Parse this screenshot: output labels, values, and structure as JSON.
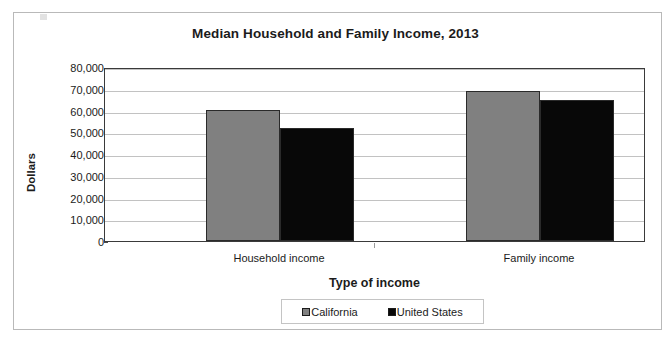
{
  "chart_data": {
    "type": "bar",
    "title": "Median Household and Family Income, 2013",
    "xlabel": "Type of income",
    "ylabel": "Dollars",
    "categories": [
      "Household income",
      "Family income"
    ],
    "series": [
      {
        "name": "California",
        "color": "#808080",
        "values": [
          60200,
          69000
        ]
      },
      {
        "name": "United States",
        "color": "#080808",
        "values": [
          52100,
          64800
        ]
      }
    ],
    "ylim": [
      0,
      80000
    ],
    "ytick_step": 10000,
    "ytick_labels": [
      "80,000",
      "70,000",
      "60,000",
      "50,000",
      "40,000",
      "30,000",
      "20,000",
      "10,000",
      "0"
    ],
    "ytick_values": [
      80000,
      70000,
      60000,
      50000,
      40000,
      30000,
      20000,
      10000,
      0
    ],
    "grid": true,
    "legend_position": "bottom"
  },
  "legend": {
    "items": [
      {
        "label": "California",
        "swatch": "gray-swatch-icon"
      },
      {
        "label": "United States",
        "swatch": "black-swatch-icon"
      }
    ]
  }
}
